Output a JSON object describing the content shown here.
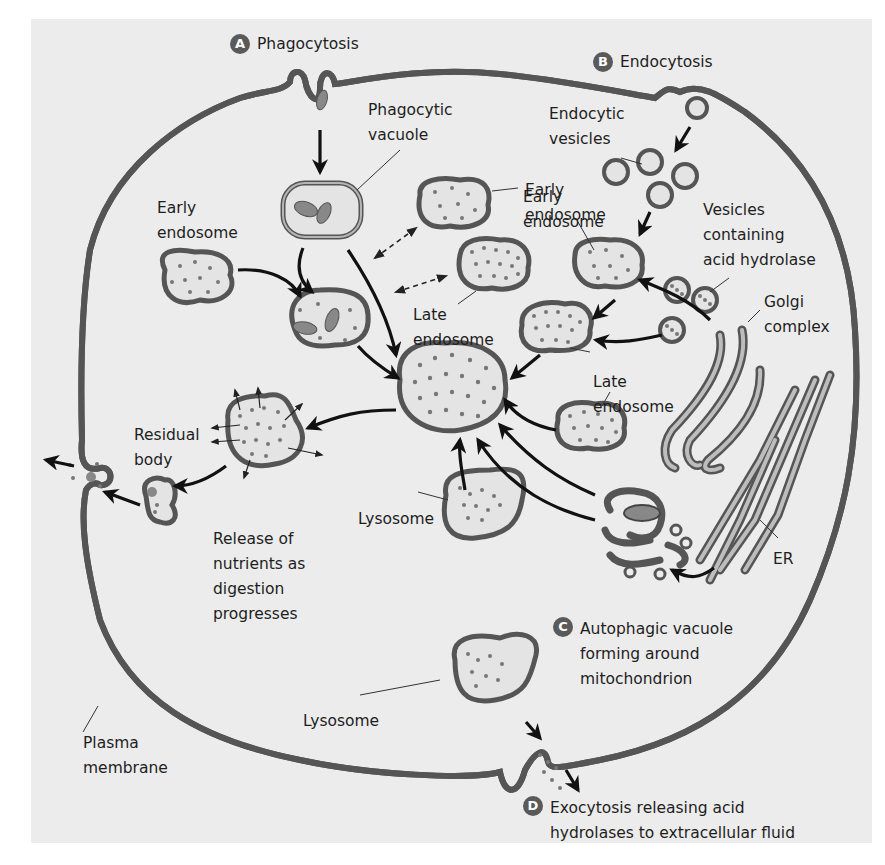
{
  "figure": {
    "colors": {
      "background": "#ececec",
      "membrane_outer": "#555555",
      "membrane_inner": "#b5b5b5",
      "dots": "#777777",
      "arrows": "#111111",
      "badge": "#5a5a5a"
    }
  },
  "steps": {
    "a": {
      "badge": "A",
      "label": "Phagocytosis"
    },
    "b": {
      "badge": "B",
      "label": "Endocytosis"
    },
    "c": {
      "badge": "C",
      "label": "Autophagic vacuole\nforming around\nmitochondrion"
    },
    "d": {
      "badge": "D",
      "label": "Exocytosis releasing acid\nhydrolases to extracellular fluid"
    }
  },
  "labels": {
    "phagocytic_vacuole": "Phagocytic\nvacuole",
    "early_endosome_left": "Early\nendosome",
    "early_endosome_center": "Early\nendosome",
    "late_endosome_center": "Late\nendosome",
    "endocytic_vesicles": "Endocytic\nvesicles",
    "early_endosome_right": "Early\nendosome",
    "vesicles_acid_hydrolase": "Vesicles\ncontaining\nacid hydrolase",
    "golgi_complex": "Golgi\ncomplex",
    "late_endosome_right": "Late\nendosome",
    "residual_body": "Residual\nbody",
    "release_of_nutrients": "Release of\nnutrients as\ndigestion\nprogresses",
    "lysosome_middle": "Lysosome",
    "er": "ER",
    "lysosome_bottom": "Lysosome",
    "plasma_membrane": "Plasma\nmembrane"
  }
}
